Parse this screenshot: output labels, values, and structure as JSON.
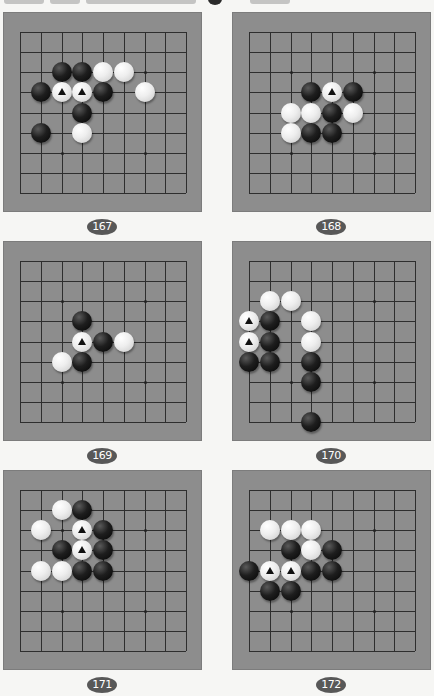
{
  "page": {
    "background": "#f6f6f4",
    "board_color": "#8d8d8d",
    "grid_color": "#2e2e2e",
    "label_color": "#585858"
  },
  "board_size": 9,
  "problems": [
    {
      "number": "167",
      "position": {
        "left": 3,
        "top": 12
      },
      "stones": [
        {
          "color": "black",
          "col": 2,
          "row": 2,
          "marked": false
        },
        {
          "color": "black",
          "col": 3,
          "row": 2,
          "marked": false
        },
        {
          "color": "white",
          "col": 4,
          "row": 2,
          "marked": false
        },
        {
          "color": "white",
          "col": 5,
          "row": 2,
          "marked": false
        },
        {
          "color": "black",
          "col": 1,
          "row": 3,
          "marked": false
        },
        {
          "color": "white",
          "col": 2,
          "row": 3,
          "marked": true
        },
        {
          "color": "white",
          "col": 3,
          "row": 3,
          "marked": true
        },
        {
          "color": "black",
          "col": 4,
          "row": 3,
          "marked": false
        },
        {
          "color": "white",
          "col": 6,
          "row": 3,
          "marked": false
        },
        {
          "color": "black",
          "col": 3,
          "row": 4,
          "marked": false
        },
        {
          "color": "black",
          "col": 1,
          "row": 5,
          "marked": false
        },
        {
          "color": "white",
          "col": 3,
          "row": 5,
          "marked": false
        }
      ]
    },
    {
      "number": "168",
      "position": {
        "left": 232,
        "top": 12
      },
      "stones": [
        {
          "color": "black",
          "col": 3,
          "row": 3,
          "marked": false
        },
        {
          "color": "white",
          "col": 4,
          "row": 3,
          "marked": true
        },
        {
          "color": "black",
          "col": 5,
          "row": 3,
          "marked": false
        },
        {
          "color": "white",
          "col": 2,
          "row": 4,
          "marked": false
        },
        {
          "color": "white",
          "col": 3,
          "row": 4,
          "marked": false
        },
        {
          "color": "black",
          "col": 4,
          "row": 4,
          "marked": false
        },
        {
          "color": "white",
          "col": 5,
          "row": 4,
          "marked": false
        },
        {
          "color": "white",
          "col": 2,
          "row": 5,
          "marked": false
        },
        {
          "color": "black",
          "col": 3,
          "row": 5,
          "marked": false
        },
        {
          "color": "black",
          "col": 4,
          "row": 5,
          "marked": false
        }
      ]
    },
    {
      "number": "169",
      "position": {
        "left": 3,
        "top": 241
      },
      "stones": [
        {
          "color": "black",
          "col": 3,
          "row": 3,
          "marked": false
        },
        {
          "color": "white",
          "col": 3,
          "row": 4,
          "marked": true
        },
        {
          "color": "black",
          "col": 4,
          "row": 4,
          "marked": false
        },
        {
          "color": "white",
          "col": 5,
          "row": 4,
          "marked": false
        },
        {
          "color": "white",
          "col": 2,
          "row": 5,
          "marked": false
        },
        {
          "color": "black",
          "col": 3,
          "row": 5,
          "marked": false
        }
      ]
    },
    {
      "number": "170",
      "position": {
        "left": 232,
        "top": 241
      },
      "stones": [
        {
          "color": "white",
          "col": 1,
          "row": 2,
          "marked": false
        },
        {
          "color": "white",
          "col": 2,
          "row": 2,
          "marked": false
        },
        {
          "color": "white",
          "col": 0,
          "row": 3,
          "marked": true
        },
        {
          "color": "black",
          "col": 1,
          "row": 3,
          "marked": false
        },
        {
          "color": "white",
          "col": 3,
          "row": 3,
          "marked": false
        },
        {
          "color": "white",
          "col": 0,
          "row": 4,
          "marked": true
        },
        {
          "color": "black",
          "col": 1,
          "row": 4,
          "marked": false
        },
        {
          "color": "white",
          "col": 3,
          "row": 4,
          "marked": false
        },
        {
          "color": "black",
          "col": 0,
          "row": 5,
          "marked": false
        },
        {
          "color": "black",
          "col": 1,
          "row": 5,
          "marked": false
        },
        {
          "color": "black",
          "col": 3,
          "row": 5,
          "marked": false
        },
        {
          "color": "black",
          "col": 3,
          "row": 6,
          "marked": false
        },
        {
          "color": "black",
          "col": 3,
          "row": 8,
          "marked": false
        }
      ]
    },
    {
      "number": "171",
      "position": {
        "left": 3,
        "top": 470
      },
      "stones": [
        {
          "color": "white",
          "col": 2,
          "row": 1,
          "marked": false
        },
        {
          "color": "black",
          "col": 3,
          "row": 1,
          "marked": false
        },
        {
          "color": "white",
          "col": 1,
          "row": 2,
          "marked": false
        },
        {
          "color": "white",
          "col": 3,
          "row": 2,
          "marked": true
        },
        {
          "color": "black",
          "col": 4,
          "row": 2,
          "marked": false
        },
        {
          "color": "black",
          "col": 2,
          "row": 3,
          "marked": false
        },
        {
          "color": "white",
          "col": 3,
          "row": 3,
          "marked": true
        },
        {
          "color": "black",
          "col": 4,
          "row": 3,
          "marked": false
        },
        {
          "color": "white",
          "col": 1,
          "row": 4,
          "marked": false
        },
        {
          "color": "white",
          "col": 2,
          "row": 4,
          "marked": false
        },
        {
          "color": "black",
          "col": 3,
          "row": 4,
          "marked": false
        },
        {
          "color": "black",
          "col": 4,
          "row": 4,
          "marked": false
        }
      ]
    },
    {
      "number": "172",
      "position": {
        "left": 232,
        "top": 470
      },
      "stones": [
        {
          "color": "white",
          "col": 1,
          "row": 2,
          "marked": false
        },
        {
          "color": "white",
          "col": 2,
          "row": 2,
          "marked": false
        },
        {
          "color": "white",
          "col": 3,
          "row": 2,
          "marked": false
        },
        {
          "color": "black",
          "col": 2,
          "row": 3,
          "marked": false
        },
        {
          "color": "white",
          "col": 3,
          "row": 3,
          "marked": false
        },
        {
          "color": "black",
          "col": 4,
          "row": 3,
          "marked": false
        },
        {
          "color": "black",
          "col": 0,
          "row": 4,
          "marked": false
        },
        {
          "color": "white",
          "col": 1,
          "row": 4,
          "marked": true
        },
        {
          "color": "white",
          "col": 2,
          "row": 4,
          "marked": true
        },
        {
          "color": "black",
          "col": 3,
          "row": 4,
          "marked": false
        },
        {
          "color": "black",
          "col": 4,
          "row": 4,
          "marked": false
        },
        {
          "color": "black",
          "col": 1,
          "row": 5,
          "marked": false
        },
        {
          "color": "black",
          "col": 2,
          "row": 5,
          "marked": false
        }
      ]
    }
  ]
}
